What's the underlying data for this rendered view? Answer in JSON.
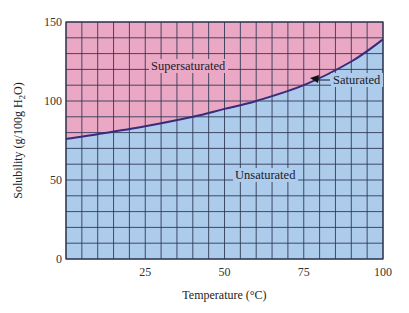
{
  "chart_data": {
    "type": "area",
    "title": "",
    "xlabel": "Temperature (°C)",
    "ylabel": "Solubility (g/100g H2O)",
    "ylabel_parts": {
      "pre": "Solubility (g/100g H",
      "sub": "2",
      "post": "O)"
    },
    "xlim": [
      0,
      100
    ],
    "ylim": [
      0,
      150
    ],
    "x_ticks": [
      25,
      50,
      75,
      100
    ],
    "y_ticks": [
      0,
      50,
      100,
      150
    ],
    "grid": {
      "on": true,
      "x_step": 5,
      "y_step": 10
    },
    "series": [
      {
        "name": "Saturated",
        "x": [
          0,
          10,
          25,
          40,
          50,
          60,
          75,
          90,
          100
        ],
        "values": [
          76,
          79,
          84,
          90,
          95,
          100,
          110,
          125,
          139
        ]
      }
    ],
    "regions": {
      "above": {
        "label": "Supersaturated",
        "color": "#EBA8C4"
      },
      "below": {
        "label": "Unsaturated",
        "color": "#ADCBEB"
      }
    },
    "annotations": [
      {
        "text": "Saturated",
        "arrow_to": {
          "x": 78,
          "y": 115
        }
      }
    ],
    "colors": {
      "curve": "#3a2a7a",
      "grid": "#2a3550"
    }
  }
}
